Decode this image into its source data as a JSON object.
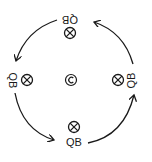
{
  "diagram": {
    "type": "rotation-cycle",
    "stroke_color": "#1a1a1a",
    "background": "#ffffff",
    "center": {
      "symbol": "©",
      "icon": "copyright-icon"
    },
    "positions": [
      {
        "id": "top",
        "label": "QB",
        "label_rotation": 180,
        "marker": "circled-x"
      },
      {
        "id": "right",
        "label": "QB",
        "label_rotation": -90,
        "marker": "circled-x"
      },
      {
        "id": "bottom",
        "label": "QB",
        "label_rotation": 0,
        "marker": "circled-x"
      },
      {
        "id": "left",
        "label": "QB",
        "label_rotation": 90,
        "marker": "circled-x"
      }
    ],
    "arrows": [
      {
        "from": "top",
        "to": "left"
      },
      {
        "from": "left",
        "to": "bottom"
      },
      {
        "from": "bottom",
        "to": "right"
      },
      {
        "from": "right",
        "to": "top"
      }
    ],
    "direction": "counter-clockwise"
  }
}
